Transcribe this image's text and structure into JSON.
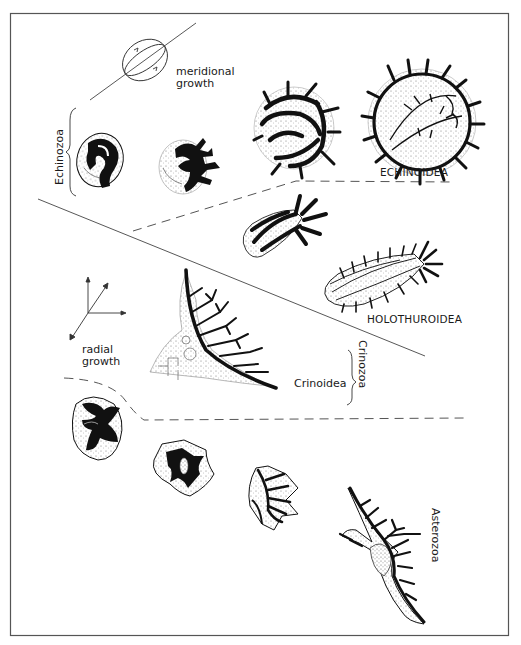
{
  "figure": {
    "type": "echinoderm-growth-diagram",
    "colors": {
      "ink": "#111111",
      "line": "#444444",
      "stipple": "#888888",
      "background": "#ffffff",
      "frame": "#555555"
    }
  },
  "growth_modes": {
    "meridional": {
      "line1": "meridional",
      "line2": "growth",
      "icon": "ellipsoid-axis-icon"
    },
    "radial": {
      "line1": "radial",
      "line2": "growth",
      "icon": "three-axis-arrows-icon"
    }
  },
  "groups": {
    "echinozoa": {
      "label": "Echinozoa"
    },
    "crinozoa": {
      "label": "Crinozoa"
    },
    "asterozoa": {
      "label": "Asterozoa"
    }
  },
  "classes": {
    "echinoidea": {
      "label": "ECHINOIDEA"
    },
    "holothuroidea": {
      "label": "HOLOTHUROIDEA"
    },
    "crinoidea": {
      "label": "Crinoidea"
    }
  },
  "specimens": [
    {
      "id": "echinozoa-1",
      "group": "Echinozoa",
      "stage": 1
    },
    {
      "id": "echinozoa-2",
      "group": "Echinozoa",
      "stage": 2
    },
    {
      "id": "echinoid-3",
      "group": "Echinoidea",
      "stage": 3
    },
    {
      "id": "echinoid-4",
      "group": "Echinoidea",
      "stage": 4
    },
    {
      "id": "holothurian-1",
      "group": "Holothuroidea",
      "stage": 1
    },
    {
      "id": "holothurian-2",
      "group": "Holothuroidea",
      "stage": 2
    },
    {
      "id": "crinoid",
      "group": "Crinoidea",
      "stage": 1
    },
    {
      "id": "asterozoa-1",
      "group": "Asterozoa",
      "stage": 1
    },
    {
      "id": "asterozoa-2",
      "group": "Asterozoa",
      "stage": 2
    },
    {
      "id": "asterozoa-3",
      "group": "Asterozoa",
      "stage": 3
    },
    {
      "id": "asterozoa-4",
      "group": "Asterozoa",
      "stage": 4
    }
  ]
}
